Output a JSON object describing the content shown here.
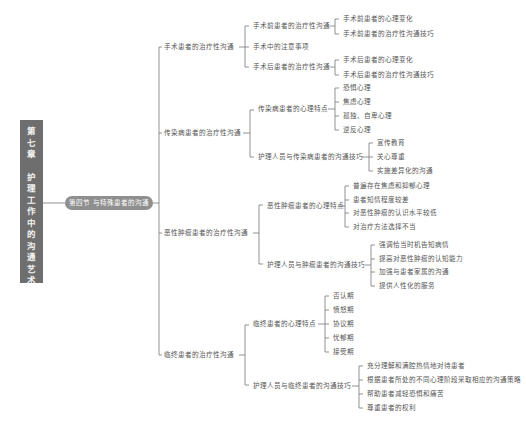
{
  "chapter": {
    "label_line1": [
      "第",
      "七",
      "章"
    ],
    "label_line2": [
      "护",
      "理",
      "工",
      "作",
      "中",
      "的",
      "沟",
      "通",
      "艺",
      "术"
    ],
    "full_title": "第七章 护理工作中的沟通艺术"
  },
  "section": {
    "label": "第四节 与特殊患者的沟通"
  },
  "tree": {
    "surgery": {
      "label": "手术患者的治疗性沟通",
      "pre": {
        "label": "手术前患者的治疗性沟通",
        "items": [
          "手术前患者的心理变化",
          "手术前患者的治疗性沟通技巧"
        ]
      },
      "intra": {
        "label": "手术中的注意事项"
      },
      "post": {
        "label": "手术后患者的治疗性沟通",
        "items": [
          "手术后患者的心理变化",
          "手术后患者的治疗性沟通技巧"
        ]
      }
    },
    "infectious": {
      "label": "传染病患者的治疗性沟通",
      "traits": {
        "label": "传染病患者的心理特点",
        "items": [
          "恐惧心理",
          "焦虑心理",
          "孤独、自卑心理",
          "逆反心理"
        ]
      },
      "skills": {
        "label": "护理人员与传染病患者的沟通技巧",
        "items": [
          "宣传教育",
          "关心尊重",
          "实施差异化的沟通"
        ]
      }
    },
    "tumor": {
      "label": "恶性肿瘤患者的治疗性沟通",
      "traits": {
        "label": "恶性肿瘤患者的心理特点",
        "items": [
          "普遍存在焦虑和抑郁心理",
          "患者知情程度较差",
          "对恶性肿瘤的认识水平较低",
          "对治疗方法选择不当"
        ]
      },
      "skills": {
        "label": "护理人员与肿瘤患者的沟通技巧",
        "items": [
          "强调恰当时机告知病情",
          "提高对恶性肿瘤的认知能力",
          "加强与患者家属的沟通",
          "提供人性化的服务"
        ]
      }
    },
    "dying": {
      "label": "临终患者的治疗性沟通",
      "traits": {
        "label": "临终患者的心理特点",
        "items": [
          "否认期",
          "愤怒期",
          "协议期",
          "忧郁期",
          "接受期"
        ]
      },
      "skills": {
        "label": "护理人员与临终患者的沟通技巧",
        "items": [
          "充分理解和满腔热情地对待患者",
          "根据患者所处的不同心理阶段采取相应的沟通策略",
          "帮助患者减轻恐惧和痛苦",
          "尊重患者的权利"
        ]
      }
    }
  },
  "colors": {
    "line": "#777777",
    "chapter_bg": "#6e6e6e",
    "pill_bg": "#8f8f8f",
    "text": "#555555"
  }
}
